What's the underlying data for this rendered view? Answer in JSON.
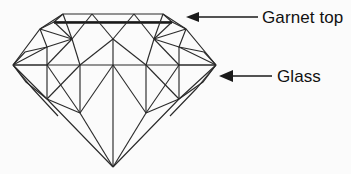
{
  "figure": {
    "background_color": "#fbfbfb",
    "line_color": "#2b2b2b",
    "text_color": "#111111"
  },
  "annotations": [
    {
      "id": "garnet-top",
      "label": "Garnet top",
      "arrow_direction": "left",
      "arrow_tail_x": 258,
      "arrow_tip_x": 186,
      "arrow_y": 17,
      "text_x": 262,
      "text_y": 23
    },
    {
      "id": "glass",
      "label": "Glass",
      "arrow_direction": "left",
      "arrow_tail_x": 272,
      "arrow_tip_x": 219,
      "arrow_y": 76,
      "text_x": 277,
      "text_y": 82
    }
  ],
  "gem": {
    "name": "brilliant-cut-gem",
    "parts": [
      {
        "name": "table-facet",
        "description": "flat top octagon outline"
      },
      {
        "name": "garnet-glass-junction",
        "description": "heavy horizontal line beneath the table marking the garnet / glass boundary"
      },
      {
        "name": "crown-facets",
        "description": "upper bezel, star and upper-girdle facets"
      },
      {
        "name": "girdle-line",
        "description": "widest horizontal line across the stone"
      },
      {
        "name": "pavilion-facets",
        "description": "lower facets converging on the culet"
      },
      {
        "name": "culet-point",
        "description": "bottom apex of the stone"
      }
    ],
    "key_points": {
      "culet": [
        113,
        167
      ],
      "girdle_left": [
        13,
        65
      ],
      "girdle_right": [
        216,
        65
      ],
      "table_left": [
        63,
        14
      ],
      "table_right": [
        163,
        14
      ]
    }
  }
}
